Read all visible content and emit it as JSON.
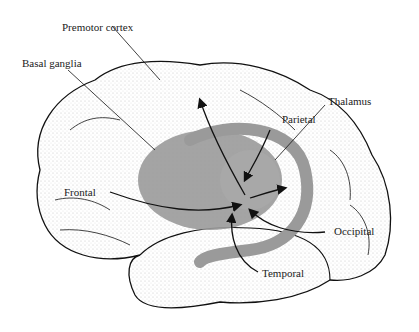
{
  "diagram": {
    "labels": {
      "premotor_cortex": "Premotor cortex",
      "basal_ganglia": "Basal ganglia",
      "thalamus": "Thalamus",
      "parietal": "Parietal",
      "frontal": "Frontal",
      "occipital": "Occipital",
      "temporal": "Temporal"
    },
    "colors": {
      "basal_ganglia_fill": "#9a9a9a",
      "outline": "#111111",
      "stipple": "#bbbbbb",
      "background": "#ffffff"
    }
  }
}
